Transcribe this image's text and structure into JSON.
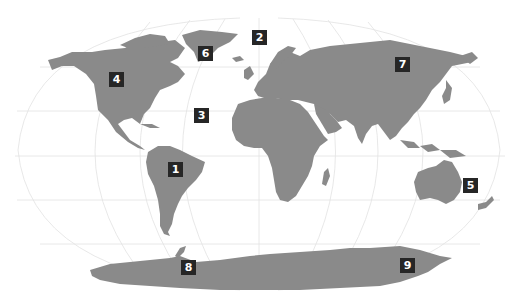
{
  "map": {
    "projection": "Robinson-style world map",
    "land_color": "#8a8a8a",
    "graticule_color": "#e2e2e2",
    "marker_color": "#262626",
    "marker_text_color": "#ffffff"
  },
  "markers": [
    {
      "label": "1",
      "region": "South America",
      "x": 168,
      "y": 162
    },
    {
      "label": "2",
      "region": "Arctic Ocean / Greenland Sea",
      "x": 252,
      "y": 30
    },
    {
      "label": "3",
      "region": "North Atlantic Ocean",
      "x": 194,
      "y": 108
    },
    {
      "label": "4",
      "region": "North America",
      "x": 109,
      "y": 72
    },
    {
      "label": "5",
      "region": "Australia",
      "x": 463,
      "y": 178
    },
    {
      "label": "6",
      "region": "Greenland",
      "x": 198,
      "y": 46
    },
    {
      "label": "7",
      "region": "Asia / Siberia",
      "x": 395,
      "y": 57
    },
    {
      "label": "8",
      "region": "Antarctic Peninsula",
      "x": 181,
      "y": 260
    },
    {
      "label": "9",
      "region": "Antarctica",
      "x": 400,
      "y": 258
    }
  ]
}
